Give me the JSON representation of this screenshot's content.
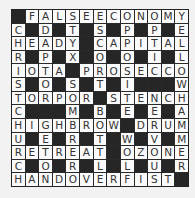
{
  "puzzle": {
    "type": "crossword",
    "rows": 13,
    "cols": 13,
    "block_char": "#",
    "grid": [
      "#FALSEECONOMY",
      "C#D#T#S#P#P#E",
      "HEADY#CAPITAL",
      "R#P#X#O#O#I#L",
      "IOTA#PROSECCO",
      "S#O#S#T#I###W",
      "TORPOR#STENCH",
      "C###M#B#E#E#A",
      "HIGHBROW#DRUM",
      "U#E#R#T#W#V#M",
      "RETREAT#OZONE",
      "C#O#R#L#L#U#R",
      "HANDOVERFIST#"
    ],
    "colors": {
      "cell": "#fafafa",
      "block": "#262626",
      "letter": "#333333",
      "background": "#f2f2f2"
    }
  }
}
